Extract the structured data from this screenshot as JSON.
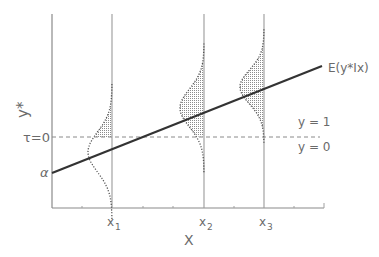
{
  "diagram": {
    "y_axis_label": "y*",
    "x_axis_label": "X",
    "threshold_label": "τ=0",
    "intercept_label": "α",
    "regression_label": "E(y*Ix)",
    "region_labels": {
      "above": "y = 1",
      "below": "y = 0"
    },
    "x_ticks": [
      {
        "name": "x",
        "sub": "1"
      },
      {
        "name": "x",
        "sub": "2"
      },
      {
        "name": "x",
        "sub": "3"
      }
    ],
    "distributions": [
      {
        "at": "x1",
        "shaded_region": "y* > τ",
        "mean_relative_to_threshold": "below"
      },
      {
        "at": "x2",
        "shaded_region": "y* > τ",
        "mean_relative_to_threshold": "above"
      },
      {
        "at": "x3",
        "shaded_region": "y* > τ",
        "mean_relative_to_threshold": "above"
      }
    ],
    "colors": {
      "line": "#333333",
      "axis": "#8a8a8a",
      "text": "#6a6a6a",
      "shade": "#9a9a9a"
    }
  }
}
